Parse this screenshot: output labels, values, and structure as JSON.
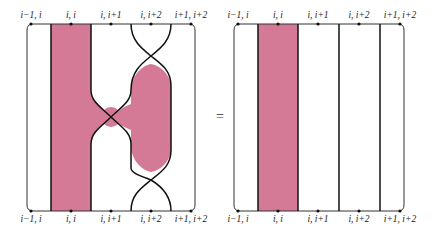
{
  "colors": {
    "region_fill": "#d57a96",
    "strand": "#111111",
    "frame": "#333333"
  },
  "left_diagram": {
    "top_labels": [
      "i−1, i",
      "i, i",
      "i, i+1",
      "i, i+2",
      "i+1, i+2"
    ],
    "bottom_labels": [
      "i−1, i",
      "i, i",
      "i, i+1",
      "i, i+2",
      "i+1, i+2"
    ]
  },
  "equals_sign": "=",
  "right_diagram": {
    "top_labels": [
      "i−1, i",
      "i, i",
      "i, i+1",
      "i, i+2",
      "i+1, i+2"
    ],
    "bottom_labels": [
      "i−1, i",
      "i, i",
      "i, i+1",
      "i, i+2",
      "i+1, i+2"
    ]
  }
}
